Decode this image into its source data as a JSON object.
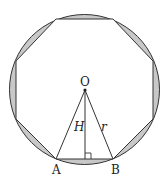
{
  "diagram": {
    "type": "regular octagon inscribed in circle",
    "colors": {
      "background": "#ffffff",
      "stroke": "#333333",
      "segment_fill": "#c8c8c8"
    },
    "circle": {
      "cx": 84.5,
      "cy": 89.5,
      "r": 75
    },
    "octagon_vertices": [
      [
        56,
        19
      ],
      [
        113,
        19
      ],
      [
        153,
        61
      ],
      [
        153,
        119
      ],
      [
        113,
        159
      ],
      [
        56,
        159
      ],
      [
        16,
        119
      ],
      [
        16,
        61
      ]
    ],
    "labels": {
      "center": "O",
      "vertex_a": "A",
      "vertex_b": "B",
      "height": "H",
      "radius": "r"
    }
  }
}
